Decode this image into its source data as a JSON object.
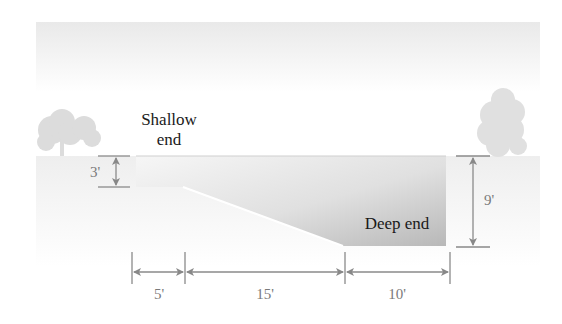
{
  "diagram": {
    "labels": {
      "shallow_line1": "Shallow",
      "shallow_line2": "end",
      "deep": "Deep end"
    },
    "dimensions": {
      "shallow_depth": "3'",
      "deep_depth": "9'",
      "segment_1": "5'",
      "segment_2": "15'",
      "segment_3": "10'"
    },
    "colors": {
      "sky": "#eeeeee",
      "ground": "#f3f3f3",
      "tree": "#dedede",
      "water_light": "#f0f0f0",
      "water_dark": "#bdbdbd",
      "dimension_line": "#8a8a8a"
    }
  }
}
